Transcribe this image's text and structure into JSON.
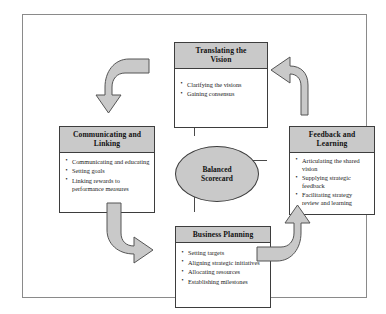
{
  "diagram": {
    "center": {
      "line1": "Balanced",
      "line2": "Scorecard"
    },
    "boxes": {
      "top": {
        "header_line1": "Translating the",
        "header_line2": "Vision",
        "bullets": [
          "Clarifying the visions",
          "Gaining consensus"
        ]
      },
      "left": {
        "header_line1": "Communicating and",
        "header_line2": "Linking",
        "bullets": [
          "Communicating and educating",
          "Setting goals",
          "Linking rewards to performance measures"
        ]
      },
      "right": {
        "header_line1": "Feedback and",
        "header_line2": "Learning",
        "bullets": [
          "Articulating the shared vision",
          "Supplying strategic feedback",
          "Facilitating strategy review and learning"
        ]
      },
      "bottom": {
        "header_line1": "Business Planning",
        "header_line2": "",
        "bullets": [
          "Setting targets",
          "Aligning strategic initiatives",
          "Allocating resources",
          "Establishing milestones"
        ]
      }
    },
    "arrows": [
      {
        "name": "arrow-top-left-down",
        "direction": "down"
      },
      {
        "name": "arrow-top-right-up",
        "direction": "up-left"
      },
      {
        "name": "arrow-bottom-left-right",
        "direction": "right"
      },
      {
        "name": "arrow-bottom-right-up",
        "direction": "up"
      }
    ],
    "colors": {
      "header_fill": "#c9c9c9",
      "box_border": "#3d3d3d",
      "arrow_fill": "#c9c9c9",
      "arrow_stroke": "#555555",
      "frame_border": "#8a8a8a",
      "background": "#ffffff"
    }
  }
}
